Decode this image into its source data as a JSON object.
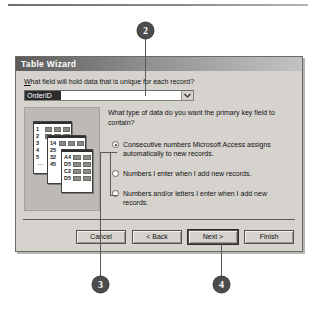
{
  "dialog": {
    "title": "Table Wizard",
    "prompt_label": "What field will hold data that is unique for each record?",
    "prompt_label_accel": "W",
    "combo": {
      "value": "OrderID",
      "placeholder": "OrderID",
      "arrow_icon": "chevron-down-icon"
    },
    "question": "What type of data do you want the primary key field to contain?",
    "options": [
      {
        "label": "Consecutive numbers Microsoft Access assigns automatically to new records.",
        "accel": "C",
        "selected": true
      },
      {
        "label": "Numbers I enter when I add new records.",
        "accel": "a",
        "selected": false
      },
      {
        "label": "Numbers and/or letters I enter when I add new records.",
        "accel": "l",
        "selected": false
      }
    ],
    "buttons": [
      {
        "label": "Cancel",
        "default": false
      },
      {
        "label": "< Back",
        "default": false
      },
      {
        "label": "Next >",
        "default": true
      },
      {
        "label": "Finish",
        "default": false
      }
    ],
    "illustration": {
      "name": "record-cards-illustration",
      "cards": [
        {
          "keys": [
            "1",
            "2",
            "3",
            "4",
            "5"
          ],
          "has_dots": true
        },
        {
          "keys": [
            "14",
            "25",
            "32",
            "45"
          ],
          "has_dots": false
        },
        {
          "keys": [
            "A4",
            "D5",
            "C2",
            "D5"
          ],
          "has_dots": false
        }
      ]
    }
  },
  "callouts": [
    {
      "number": "2"
    },
    {
      "number": "3"
    },
    {
      "number": "4"
    }
  ]
}
